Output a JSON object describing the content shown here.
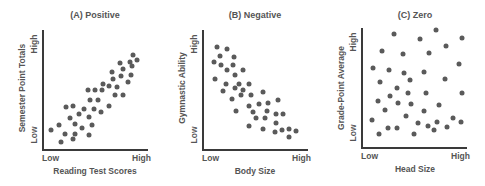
{
  "chart_data": [
    {
      "type": "scatter",
      "title": "(A) Positive",
      "xlabel": "Reading Test Scores",
      "ylabel": "Semester Point Totals",
      "x_ticks": [
        "Low",
        "High"
      ],
      "y_ticks": [
        "Low",
        "High"
      ],
      "xlim": [
        0,
        100
      ],
      "ylim": [
        0,
        100
      ],
      "grid": false,
      "points": [
        [
          85,
          79
        ],
        [
          82,
          73
        ],
        [
          89,
          75
        ],
        [
          84,
          70
        ],
        [
          73,
          72
        ],
        [
          75,
          67
        ],
        [
          65,
          65
        ],
        [
          74,
          61
        ],
        [
          83,
          62
        ],
        [
          80,
          56
        ],
        [
          66,
          59
        ],
        [
          57,
          55
        ],
        [
          62,
          53
        ],
        [
          70,
          52
        ],
        [
          68,
          45
        ],
        [
          75,
          45
        ],
        [
          42,
          50
        ],
        [
          49,
          50
        ],
        [
          56,
          50
        ],
        [
          44,
          41
        ],
        [
          52,
          41
        ],
        [
          62,
          36
        ],
        [
          55,
          31
        ],
        [
          48,
          34
        ],
        [
          39,
          34
        ],
        [
          28,
          36
        ],
        [
          22,
          35
        ],
        [
          34,
          29
        ],
        [
          25,
          26
        ],
        [
          43,
          27
        ],
        [
          30,
          21
        ],
        [
          46,
          20
        ],
        [
          37,
          18
        ],
        [
          15,
          20
        ],
        [
          8,
          16
        ],
        [
          21,
          13
        ],
        [
          30,
          13
        ],
        [
          43,
          12
        ],
        [
          17,
          6
        ],
        [
          28,
          8
        ]
      ]
    },
    {
      "type": "scatter",
      "title": "(B) Negative",
      "xlabel": "Body Size",
      "ylabel": "Gymnastic Ability",
      "x_ticks": [
        "Low",
        "High"
      ],
      "y_ticks": [
        "Low",
        "High"
      ],
      "xlim": [
        0,
        100
      ],
      "ylim": [
        0,
        100
      ],
      "grid": false,
      "points": [
        [
          14,
          86
        ],
        [
          24,
          84
        ],
        [
          17,
          78
        ],
        [
          30,
          77
        ],
        [
          11,
          73
        ],
        [
          18,
          71
        ],
        [
          29,
          71
        ],
        [
          24,
          66
        ],
        [
          39,
          66
        ],
        [
          31,
          62
        ],
        [
          12,
          59
        ],
        [
          23,
          55
        ],
        [
          35,
          55
        ],
        [
          44,
          55
        ],
        [
          31,
          51
        ],
        [
          39,
          50
        ],
        [
          20,
          49
        ],
        [
          37,
          45
        ],
        [
          46,
          45
        ],
        [
          58,
          48
        ],
        [
          28,
          42
        ],
        [
          54,
          38
        ],
        [
          62,
          39
        ],
        [
          72,
          41
        ],
        [
          44,
          36
        ],
        [
          32,
          32
        ],
        [
          48,
          31
        ],
        [
          61,
          32
        ],
        [
          51,
          26
        ],
        [
          59,
          26
        ],
        [
          70,
          29
        ],
        [
          76,
          29
        ],
        [
          70,
          22
        ],
        [
          44,
          19
        ],
        [
          58,
          17
        ],
        [
          69,
          14
        ],
        [
          75,
          16
        ],
        [
          82,
          17
        ],
        [
          89,
          15
        ],
        [
          82,
          10
        ]
      ]
    },
    {
      "type": "scatter",
      "title": "(C) Zero",
      "xlabel": "Head Size",
      "ylabel": "Grade-Point Average",
      "x_ticks": [
        "Low",
        "High"
      ],
      "y_ticks": [
        "Low",
        "High"
      ],
      "xlim": [
        0,
        100
      ],
      "ylim": [
        0,
        100
      ],
      "grid": false,
      "points": [
        [
          31,
          95
        ],
        [
          71,
          98
        ],
        [
          56,
          91
        ],
        [
          95,
          92
        ],
        [
          80,
          85
        ],
        [
          20,
          81
        ],
        [
          40,
          78
        ],
        [
          64,
          79
        ],
        [
          92,
          70
        ],
        [
          11,
          66
        ],
        [
          26,
          65
        ],
        [
          41,
          62
        ],
        [
          59,
          63
        ],
        [
          46,
          56
        ],
        [
          79,
          57
        ],
        [
          18,
          55
        ],
        [
          34,
          50
        ],
        [
          44,
          45
        ],
        [
          61,
          45
        ],
        [
          95,
          45
        ],
        [
          27,
          43
        ],
        [
          16,
          39
        ],
        [
          35,
          37
        ],
        [
          47,
          36
        ],
        [
          74,
          35
        ],
        [
          23,
          31
        ],
        [
          59,
          30
        ],
        [
          42,
          26
        ],
        [
          87,
          24
        ],
        [
          10,
          23
        ],
        [
          54,
          20
        ],
        [
          72,
          21
        ],
        [
          94,
          21
        ],
        [
          25,
          16
        ],
        [
          34,
          16
        ],
        [
          63,
          18
        ],
        [
          81,
          17
        ],
        [
          69,
          14
        ],
        [
          17,
          11
        ],
        [
          50,
          11
        ]
      ]
    }
  ],
  "panels": [
    {
      "title": "(A) Positive",
      "xlabel": "Reading Test Scores",
      "ylabel": "Semester Point Totals",
      "x_low": "Low",
      "x_high": "High",
      "y_low": "Low",
      "y_high": "High"
    },
    {
      "title": "(B) Negative",
      "xlabel": "Body Size",
      "ylabel": "Gymnastic Ability",
      "x_low": "Low",
      "x_high": "High",
      "y_low": "Low",
      "y_high": "High"
    },
    {
      "title": "(C) Zero",
      "xlabel": "Head Size",
      "ylabel": "Grade-Point Average",
      "x_low": "Low",
      "x_high": "High",
      "y_low": "Low",
      "y_high": "High"
    }
  ],
  "colors": {
    "dot": "#5a5a5a",
    "axis": "#3a3a3a",
    "text": "#555555"
  }
}
